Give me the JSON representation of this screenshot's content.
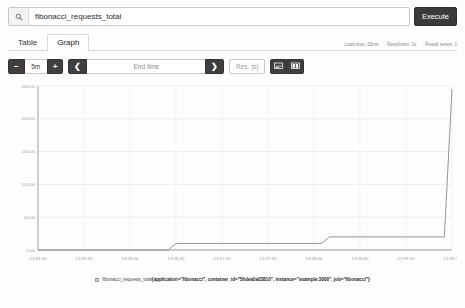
{
  "search": {
    "value": "fibonacci_requests_total",
    "placeholder": "Expression (press Shift+Enter for newlines)",
    "icon": "search-icon"
  },
  "execute_label": "Execute",
  "tabs": [
    {
      "label": "Table",
      "active": false
    },
    {
      "label": "Graph",
      "active": true
    }
  ],
  "meta": {
    "load_time": "Load time: 15ms",
    "resolution": "Resolution: 1s",
    "result_series": "Result series: 1"
  },
  "toolbar": {
    "decrease_label": "−",
    "range_value": "5m",
    "increase_label": "+",
    "prev_label": "❮",
    "end_time_placeholder": "End time",
    "next_label": "❯",
    "resolution_placeholder": "Res. (s)",
    "chart_toggle_icon": "line-chart-icon",
    "stacked_toggle_icon": "stacked-chart-icon"
  },
  "legend": {
    "swatch_color": "#c9c9c9",
    "metric": "fibonacci_requests_total",
    "labels": "{application=\"fibonacci\", container_id=\"56dea0a03810\", instance=\"example:3000\", job=\"fibonacci\"}"
  },
  "chart_data": {
    "type": "line",
    "title": "",
    "xlabel": "",
    "ylabel": "",
    "grid": true,
    "legend_position": "bottom",
    "line_color": "#8a8a8a",
    "ylim": [
      0,
      250
    ],
    "yticks": [
      0,
      50,
      100,
      150,
      200,
      250
    ],
    "ytick_labels": [
      "0.00",
      "50.00",
      "100.00",
      "150.00",
      "200.00",
      "250.00"
    ],
    "xtick_labels": [
      "13:35:00",
      "13:35:30",
      "13:36:00",
      "13:36:30",
      "13:37:00",
      "13:37:30",
      "13:38:00",
      "13:38:30",
      "13:39:00",
      "13:39:30"
    ],
    "series": [
      {
        "name": "fibonacci_requests_total",
        "step": true,
        "x": [
          "13:35:00",
          "13:36:25",
          "13:36:30",
          "13:38:05",
          "13:38:10",
          "13:39:25",
          "13:39:30",
          "13:39:55"
        ],
        "values": [
          0,
          0,
          10,
          10,
          20,
          20,
          245,
          245
        ]
      }
    ]
  }
}
